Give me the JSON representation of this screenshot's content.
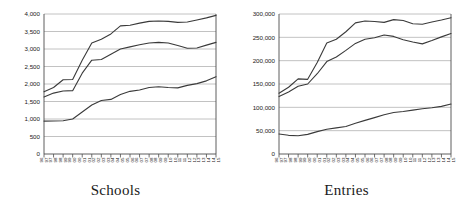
{
  "figure": {
    "background": "#ffffff",
    "line_color": "#3a3a3a",
    "grid_color": "#b3b3b3",
    "axis_color": "#4d4d4d"
  },
  "chart_data": [
    {
      "type": "line",
      "title": "Schools",
      "xlabel": "",
      "ylabel": "",
      "ylim": [
        0,
        4000
      ],
      "ytick_values": [
        0,
        500,
        1000,
        1500,
        2000,
        2500,
        3000,
        3500,
        4000
      ],
      "ytick_labels": [
        "0",
        "500",
        "1,000",
        "1,500",
        "2,000",
        "2,500",
        "3,000",
        "3,500",
        "4,000"
      ],
      "grid": true,
      "legend": "none",
      "categories": [
        "96/97",
        "97/98",
        "98/99",
        "99/00",
        "00/01",
        "01/02",
        "02/03",
        "03/04",
        "04/05",
        "05/06",
        "06/07",
        "07/08",
        "08/09",
        "09/10",
        "10/11",
        "11/12",
        "12/13",
        "13/14",
        "14/15"
      ],
      "series": [
        {
          "name": "series-top",
          "values": [
            1780,
            1900,
            2120,
            2130,
            2680,
            3170,
            3280,
            3430,
            3660,
            3680,
            3740,
            3790,
            3800,
            3790,
            3760,
            3770,
            3830,
            3890,
            3960
          ]
        },
        {
          "name": "series-middle",
          "values": [
            1630,
            1740,
            1800,
            1810,
            2310,
            2680,
            2700,
            2850,
            3000,
            3060,
            3120,
            3170,
            3190,
            3170,
            3100,
            3020,
            3030,
            3110,
            3190
          ]
        },
        {
          "name": "series-bottom",
          "values": [
            940,
            945,
            950,
            1000,
            1200,
            1400,
            1530,
            1560,
            1700,
            1790,
            1830,
            1900,
            1920,
            1900,
            1890,
            1960,
            2010,
            2090,
            2210
          ]
        }
      ]
    },
    {
      "type": "line",
      "title": "Entries",
      "xlabel": "",
      "ylabel": "",
      "ylim": [
        0,
        300000
      ],
      "ytick_values": [
        0,
        50000,
        100000,
        150000,
        200000,
        250000,
        300000
      ],
      "ytick_labels": [
        "0",
        "50,000",
        "100,000",
        "150,000",
        "200,000",
        "250,000",
        "300,000"
      ],
      "grid": true,
      "legend": "none",
      "categories": [
        "96/97",
        "97/98",
        "98/99",
        "99/00",
        "00/01",
        "01/02",
        "02/03",
        "03/04",
        "04/05",
        "05/06",
        "06/07",
        "07/08",
        "08/09",
        "09/10",
        "10/11",
        "11/12",
        "12/13",
        "13/14",
        "14/15"
      ],
      "series": [
        {
          "name": "series-top",
          "values": [
            130000,
            143000,
            161000,
            160000,
            196000,
            238000,
            246000,
            262000,
            281000,
            285000,
            284000,
            282000,
            288000,
            286000,
            279000,
            278000,
            283000,
            287000,
            292000
          ]
        },
        {
          "name": "series-middle",
          "values": [
            123000,
            133000,
            145000,
            150000,
            172000,
            198000,
            208000,
            222000,
            237000,
            246000,
            249000,
            255000,
            252000,
            245000,
            240000,
            236000,
            243000,
            251000,
            258000
          ]
        },
        {
          "name": "series-bottom",
          "values": [
            43000,
            40000,
            39000,
            42000,
            48000,
            53000,
            56000,
            59000,
            66000,
            72000,
            78000,
            84000,
            89000,
            91000,
            94000,
            97000,
            99000,
            102000,
            107000
          ]
        }
      ]
    }
  ]
}
